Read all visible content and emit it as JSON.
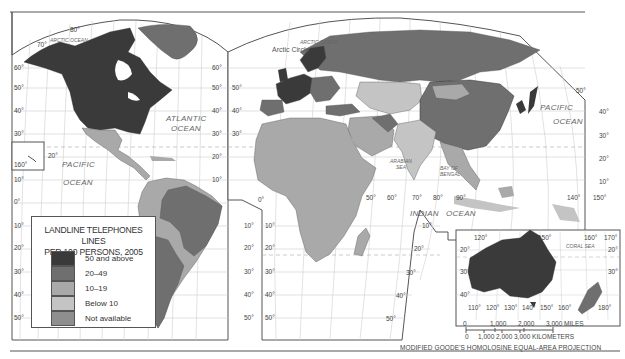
{
  "map": {
    "title": "Landline Telephones Lines per 100 Persons, 2005",
    "projection": "MODIFIED GOODE'S HOMOLOSINE EQUAL-AREA PROJECTION",
    "colors": {
      "ocean": "#ffffff",
      "grid": "#c8c8c8",
      "frame": "#555555",
      "class_50_plus": "#3a3a3a",
      "class_20_49": "#6f6f6f",
      "class_10_19": "#a9a9a9",
      "class_below_10": "#c4c4c4",
      "class_na": "#8e8e8e"
    }
  },
  "legend": {
    "title_line1": "LANDLINE TELEPHONES LINES",
    "title_line2": "PER 100 PERSONS, 2005",
    "items": [
      {
        "label": "50 and above",
        "color": "#3a3a3a"
      },
      {
        "label": "20–49",
        "color": "#6f6f6f"
      },
      {
        "label": "10–19",
        "color": "#a9a9a9"
      },
      {
        "label": "Below 10",
        "color": "#c4c4c4"
      },
      {
        "label": "Not available",
        "color": "#8e8e8e"
      }
    ]
  },
  "labels": {
    "oceans": {
      "arctic_west": "ARCTIC OCEAN",
      "arctic_east": "ARCTIC OCEAN",
      "arctic_circle": "Arctic Circle",
      "atlantic_1": "ATLANTIC",
      "atlantic_2": "OCEAN",
      "pacific_w_1": "PACIFIC",
      "pacific_w_2": "OCEAN",
      "pacific_e_1": "PACIFIC",
      "pacific_e_2": "OCEAN",
      "indian_1": "INDIAN",
      "indian_2": "OCEAN",
      "arabian_1": "ARABIAN",
      "arabian_2": "SEA",
      "bengal_1": "BAY OF",
      "bengal_2": "BENGAL",
      "coral": "CORAL   SEA"
    },
    "lat_left": [
      "60°",
      "50°",
      "40°",
      "30°",
      "10°",
      "0°",
      "10°",
      "20°",
      "30°",
      "40°",
      "50°"
    ],
    "lat_mid_left": [
      "60°",
      "50°",
      "40°",
      "30°",
      "20°",
      "10°"
    ],
    "lat_mid_right": [
      "50°",
      "40°",
      "30°"
    ],
    "lat_south_sa": [
      "10°",
      "20°",
      "30°",
      "40°",
      "50°"
    ],
    "lat_south_af": [
      "10°",
      "20°",
      "30°",
      "40°",
      "50°"
    ],
    "lat_south_af_r": [
      "10°",
      "20°",
      "30°",
      "40°",
      "50°"
    ],
    "lat_right": [
      "50°",
      "40°",
      "30°",
      "20°",
      "10°"
    ],
    "lon_top_w": [
      "80°",
      "70°"
    ],
    "hawaii_lon": "160°",
    "hawaii_lat": "20°",
    "lon_equator": [
      "0°",
      "50°",
      "60°",
      "70°",
      "80°",
      "90°",
      "140°",
      "150°"
    ],
    "inset_top": [
      "120°",
      "150°",
      "160°",
      "170°"
    ],
    "inset_left": [
      "20°",
      "30°",
      "40°"
    ],
    "inset_right": [
      "20°",
      "30°"
    ],
    "inset_bottom": [
      "110°",
      "120°",
      "130°",
      "140°",
      "150°",
      "160°",
      "180°"
    ]
  },
  "scale": {
    "miles_ticks": [
      "0",
      "1,000",
      "2,000",
      "3,000 MILES"
    ],
    "km_ticks": [
      "0",
      "1,000",
      "2,000",
      "3,000 KILOMETERS"
    ]
  }
}
